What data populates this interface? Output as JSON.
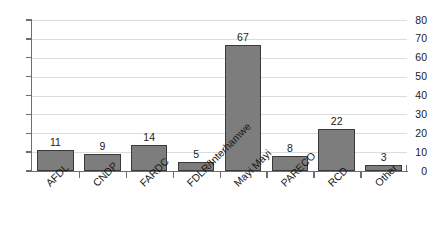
{
  "chart_data": {
    "type": "bar",
    "title": "",
    "subtitle": "",
    "xlabel": "",
    "ylabel": "",
    "ylim": [
      0,
      80
    ],
    "ytick_step": 10,
    "yticks": [
      0,
      10,
      20,
      30,
      40,
      50,
      60,
      70,
      80
    ],
    "grid": true,
    "grid_axis": "y",
    "legend": false,
    "legend_position": "none",
    "data_labels": true,
    "categories": [
      "AFDL",
      "CNDP",
      "FARDC",
      "FDLR/Interhamwe",
      "Mayi Mayi",
      "PARECO",
      "RCD",
      "Other"
    ],
    "values": [
      11,
      9,
      14,
      5,
      67,
      8,
      22,
      3
    ],
    "bar_color": "#7d7d7d",
    "bar_edge_color": "#3a3a3a",
    "gridline_color": "#dcdcdc",
    "axis_color": "#6e6e6e",
    "text_color": "#1a1a1a",
    "background_color": "#ffffff"
  }
}
